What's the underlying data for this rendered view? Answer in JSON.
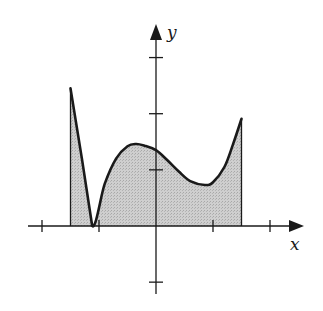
{
  "chart_data": {
    "type": "area",
    "title": "",
    "xlabel": "x",
    "ylabel": "y",
    "xlim": [
      -2.2,
      2.7
    ],
    "ylim": [
      -1.1,
      3.4
    ],
    "x_ticks": [
      -2,
      -1,
      1,
      2
    ],
    "y_ticks": [
      -1,
      1,
      2,
      3
    ],
    "tick_labels_shown": false,
    "grid": false,
    "legend": null,
    "shaded_region": {
      "description": "Region between the curve and the x-axis from x = a to x = b, shaded gray",
      "x_start": -1.5,
      "x_end": 1.5,
      "fill_color": "#c8c8c8",
      "stroke_color": "#1a1a1a"
    },
    "series": [
      {
        "name": "f(x)",
        "x": [
          -1.5,
          -1.3,
          -1.12,
          -0.9,
          -0.7,
          -0.5,
          -0.35,
          -0.2,
          0.0,
          0.2,
          0.4,
          0.6,
          0.86,
          1.0,
          1.2,
          1.35,
          1.5
        ],
        "y": [
          2.45,
          1.2,
          0.0,
          0.75,
          1.2,
          1.42,
          1.46,
          1.43,
          1.35,
          1.17,
          0.97,
          0.8,
          0.73,
          0.78,
          1.05,
          1.45,
          1.91
        ]
      }
    ],
    "annotations": []
  },
  "axes": {
    "x_label": "x",
    "y_label": "y",
    "origin_px": [
      156,
      226
    ],
    "unit_px": 57
  }
}
